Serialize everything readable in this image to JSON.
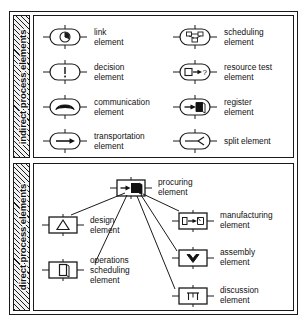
{
  "diagram": {
    "sections": [
      {
        "id": "indirect",
        "label": "indirect process elements",
        "shape_style": "stadium",
        "items": [
          {
            "name": "link element",
            "label": "link\nelement",
            "icon": "clock-icon",
            "column": "left",
            "row": 1
          },
          {
            "name": "decision element",
            "label": "decision\nelement",
            "icon": "exclamation-icon",
            "column": "left",
            "row": 2
          },
          {
            "name": "communication element",
            "label": "communication\nelement",
            "icon": "phone-handset-icon",
            "column": "left",
            "row": 3
          },
          {
            "name": "transportation element",
            "label": "transportation\nelement",
            "icon": "arrow-right-icon",
            "column": "left",
            "row": 4
          },
          {
            "name": "scheduling element",
            "label": "scheduling\nelement",
            "icon": "network-tree-icon",
            "column": "right",
            "row": 1
          },
          {
            "name": "resource test element",
            "label": "resource test\nelement",
            "icon": "box-arrow-question-icon",
            "column": "right",
            "row": 2
          },
          {
            "name": "register element",
            "label": "register\nelement",
            "icon": "arrow-into-book-icon",
            "column": "right",
            "row": 3
          },
          {
            "name": "split element",
            "label": "split element",
            "icon": "fork-split-icon",
            "column": "right",
            "row": 4
          }
        ]
      },
      {
        "id": "direct",
        "label": "direct process elements",
        "shape_style": "rectangle",
        "items": [
          {
            "name": "procuring element",
            "label": "procuring\nelement",
            "icon": "arrow-into-filled-block-icon"
          },
          {
            "name": "design element",
            "label": "design\nelement",
            "icon": "triangle-icon"
          },
          {
            "name": "operations scheduling element",
            "label": "operations\nscheduling\nelement",
            "icon": "vertical-block-icon"
          },
          {
            "name": "manufacturing element",
            "label": "manufacturing\nelement",
            "icon": "box-arrow-box-icon"
          },
          {
            "name": "assembly element",
            "label": "assembly\nelement",
            "icon": "chevron-down-icon"
          },
          {
            "name": "discussion element",
            "label": "discussion\nelement",
            "icon": "table-meeting-icon"
          }
        ],
        "connections": [
          {
            "from": "procuring element",
            "to": "design element"
          },
          {
            "from": "procuring element",
            "to": "operations scheduling element"
          },
          {
            "from": "procuring element",
            "to": "manufacturing element"
          },
          {
            "from": "procuring element",
            "to": "assembly element"
          },
          {
            "from": "procuring element",
            "to": "discussion element"
          }
        ]
      }
    ]
  },
  "colors": {
    "stroke": "#1a1a1a",
    "background": "#ffffff",
    "fill_dark": "#111111",
    "hatch": "#1a1a1a"
  }
}
